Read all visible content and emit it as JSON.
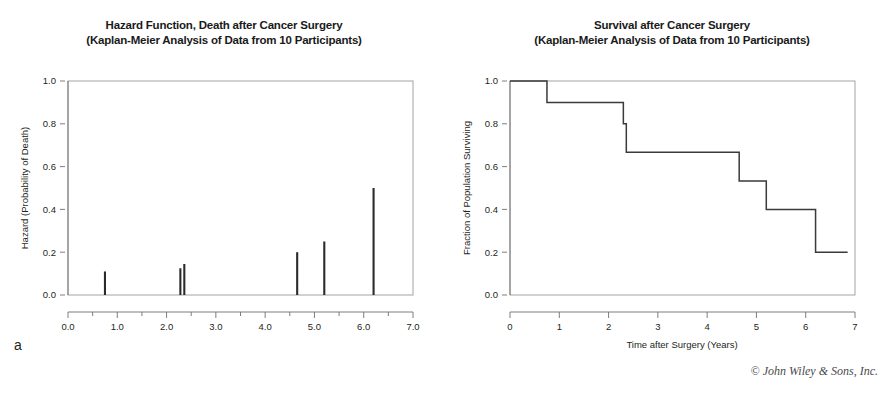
{
  "figure": {
    "copyright": "© John Wiley & Sons, Inc.",
    "panel_a_letter": "a",
    "panel_b_letter": "b"
  },
  "panels": [
    {
      "letter": "a",
      "title_line1": "Hazard Function, Death after Cancer Surgery",
      "title_line2": "(Kaplan-Meier Analysis of Data from 10 Participants)"
    },
    {
      "letter": "b",
      "title_line1": "Survival after Cancer Surgery",
      "title_line2": "(Kaplan-Meier Analysis of Data from 10 Participants)"
    }
  ],
  "chart_data": [
    {
      "type": "bar",
      "panel": "a",
      "title": "Hazard Function, Death after Cancer Surgery (Kaplan-Meier Analysis of Data from 10 Participants)",
      "xlabel": "",
      "ylabel": "Hazard (Probability of Death)",
      "xlim": [
        0.0,
        7.0
      ],
      "ylim": [
        0.0,
        1.0
      ],
      "grid": false,
      "legend": "none",
      "xticks": [
        0.0,
        1.0,
        2.0,
        3.0,
        4.0,
        5.0,
        6.0,
        7.0
      ],
      "xtick_labels": [
        "0.0",
        "1.0",
        "2.0",
        "3.0",
        "4.0",
        "5.0",
        "6.0",
        "7.0"
      ],
      "xminor_ticks": [
        0.5,
        1.5,
        2.5,
        3.5,
        4.5,
        5.5,
        6.5
      ],
      "yticks": [
        0.0,
        0.2,
        0.4,
        0.6,
        0.8,
        1.0
      ],
      "ytick_labels": [
        "0.0",
        "0.2",
        "0.4",
        "0.6",
        "0.8",
        "1.0"
      ],
      "x": [
        0.75,
        2.28,
        2.36,
        4.65,
        5.2,
        6.2
      ],
      "values": [
        0.11,
        0.125,
        0.145,
        0.2,
        0.25,
        0.5
      ],
      "bar_width_px": 2.1
    },
    {
      "type": "line",
      "panel": "b",
      "subtype": "step",
      "title": "Survival after Cancer Surgery (Kaplan-Meier Analysis of Data from 10 Participants)",
      "xlabel": "Time after Surgery (Years)",
      "ylabel": "Fraction of Population Surviving",
      "xlim": [
        0.0,
        7.0
      ],
      "ylim": [
        0.0,
        1.0
      ],
      "grid": false,
      "legend": "none",
      "xticks": [
        0,
        1,
        2,
        3,
        4,
        5,
        6,
        7
      ],
      "xtick_labels": [
        "0",
        "1",
        "2",
        "3",
        "4",
        "5",
        "6",
        "7"
      ],
      "yticks": [
        0.0,
        0.2,
        0.4,
        0.6,
        0.8,
        1.0
      ],
      "ytick_labels": [
        "0.0",
        "0.2",
        "0.4",
        "0.6",
        "0.8",
        "1.0"
      ],
      "series": [
        {
          "name": "Survival",
          "x": [
            0.0,
            0.75,
            0.75,
            2.3,
            2.3,
            2.36,
            2.36,
            4.65,
            4.65,
            5.2,
            5.2,
            6.2,
            6.2,
            6.85
          ],
          "y": [
            1.0,
            1.0,
            0.9,
            0.9,
            0.8,
            0.8,
            0.667,
            0.667,
            0.533,
            0.533,
            0.4,
            0.4,
            0.2,
            0.2
          ]
        }
      ],
      "step_events": [
        {
          "time": 0.75,
          "from": 1.0,
          "to": 0.9
        },
        {
          "time": 2.3,
          "from": 0.9,
          "to": 0.8
        },
        {
          "time": 2.36,
          "from": 0.8,
          "to": 0.667
        },
        {
          "time": 4.65,
          "from": 0.667,
          "to": 0.533
        },
        {
          "time": 5.2,
          "from": 0.533,
          "to": 0.4
        },
        {
          "time": 6.2,
          "from": 0.4,
          "to": 0.2
        }
      ]
    }
  ]
}
